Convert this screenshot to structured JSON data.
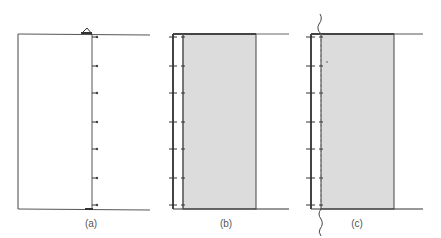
{
  "figure": {
    "panels": [
      {
        "id": "a",
        "label": "(a)",
        "label_x": 91,
        "description": "Empty rectangular region with wall and node markers on right vertical edge",
        "box": {
          "left": 18,
          "top": 34,
          "right": 92,
          "bottom": 209
        },
        "line_right": 150,
        "ticks_y": [
          37,
          66,
          93,
          122,
          149,
          178,
          205
        ],
        "top_marker": "triangle-icon"
      },
      {
        "id": "b",
        "label": "(b)",
        "label_x": 226,
        "description": "Shaded region bounded by double vertical wall lines with tick marks",
        "outer_x": 173,
        "inner_x": 183,
        "box": {
          "left": 183,
          "top": 34,
          "right": 256,
          "bottom": 209
        },
        "line_right": 289,
        "ticks_y": [
          37,
          66,
          93,
          122,
          149,
          178,
          205
        ]
      },
      {
        "id": "c",
        "label": "(c)",
        "label_x": 357,
        "description": "Shaded region with solid outer wall, dashed inner boundary and wavy cut line",
        "outer_x": 311,
        "inner_x": 321,
        "box": {
          "left": 321,
          "top": 34,
          "right": 394,
          "bottom": 209
        },
        "line_right": 423,
        "ticks_y": [
          37,
          66,
          93,
          122,
          149,
          178,
          205
        ],
        "cut_marker": "wavy-break-icon"
      }
    ],
    "colors": {
      "line": "#444444",
      "shade": "#dcdcdc",
      "label": "#555555"
    }
  }
}
